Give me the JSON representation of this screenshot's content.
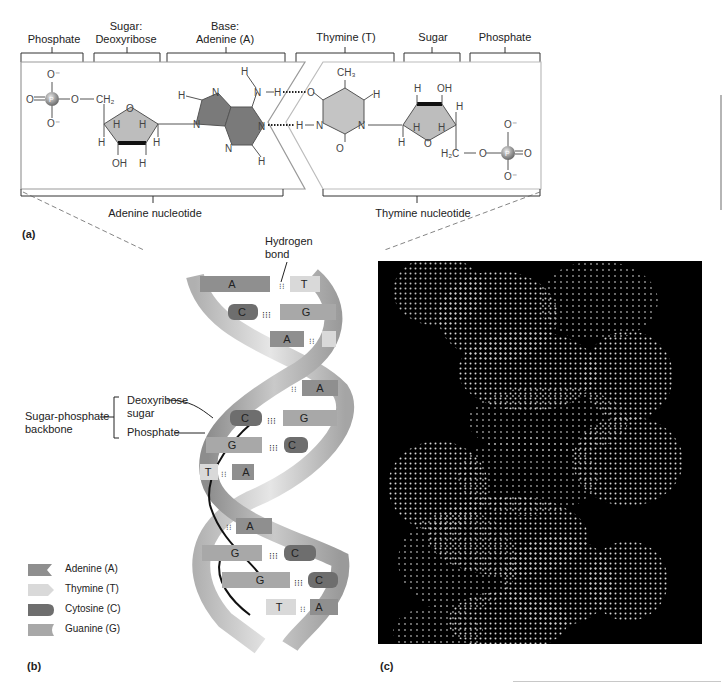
{
  "panel_a": {
    "letter": "(a)",
    "top_labels": [
      {
        "text": "Phosphate"
      },
      {
        "text": "Sugar:\nDeoxyribose"
      },
      {
        "text": "Base:\nAdenine (A)"
      },
      {
        "text": "Thymine (T)"
      },
      {
        "text": "Sugar"
      },
      {
        "text": "Phosphate"
      }
    ],
    "bottom_labels": {
      "left": "Adenine nucleotide",
      "right": "Thymine nucleotide"
    },
    "atoms": {
      "O": "O",
      "O_minus": "O⁻",
      "P": "P",
      "CH2": "CH₂",
      "H2C": "H₂C",
      "H": "H",
      "N": "N",
      "OH": "OH",
      "CH3": "CH₃"
    }
  },
  "panel_b": {
    "letter": "(b)",
    "hydrogen_bond_label": "Hydrogen\nbond",
    "backbone_label": "Sugar-phosphate\nbackbone",
    "deoxyribose_label": "Deoxyribose\nsugar",
    "phosphate_label": "Phosphate",
    "base_pairs": [
      {
        "left": "A",
        "right": "T"
      },
      {
        "left": "C",
        "right": "G"
      },
      {
        "left": "A",
        "right": "T"
      },
      {
        "left": "",
        "right": "A"
      },
      {
        "left": "C",
        "right": "G"
      },
      {
        "left": "G",
        "right": "C"
      },
      {
        "left": "T",
        "right": "A"
      },
      {
        "left": "",
        "right": "A"
      },
      {
        "left": "G",
        "right": "C"
      },
      {
        "left": "G",
        "right": "C"
      },
      {
        "left": "T",
        "right": "A"
      }
    ],
    "legend": [
      {
        "name": "Adenine (A)",
        "color": "#8f8f8f"
      },
      {
        "name": "Thymine (T)",
        "color": "#d9d9d9"
      },
      {
        "name": "Cytosine (C)",
        "color": "#6e6e6e"
      },
      {
        "name": "Guanine (G)",
        "color": "#a8a8a8"
      }
    ]
  },
  "panel_c": {
    "letter": "(c)"
  }
}
